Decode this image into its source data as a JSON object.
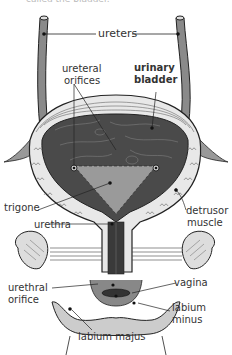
{
  "caption": "called the bladder.",
  "labels": {
    "ureters": "ureters",
    "ureteral_orifices_1": "ureteral",
    "ureteral_orifices_2": "orifices",
    "urinary_bladder_1": "urinary",
    "urinary_bladder_2": "bladder",
    "trigone": "trigone",
    "urethra": "urethra",
    "detrusor_1": "detrusor",
    "detrusor_2": "muscle",
    "urethral_orifice_1": "urethral",
    "urethral_orifice_2": "orifice",
    "vagina": "vagina",
    "labium_minus_1": "labium",
    "labium_minus_2": "minus",
    "labium_majus": "labium majus"
  },
  "colors": {
    "line": "#222222",
    "fill_dark": "#555555",
    "fill_mid": "#8a8a8a",
    "fill_light": "#bdbdbd",
    "text": "#333333"
  }
}
